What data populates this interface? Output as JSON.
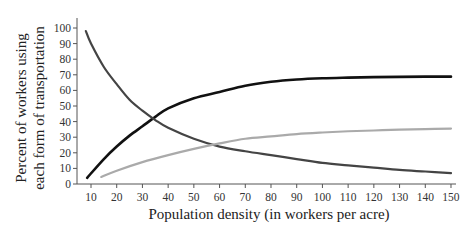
{
  "chart_data": {
    "type": "line",
    "title": "",
    "xlabel": "Population density (in workers per acre)",
    "ylabel_line1": "Percent of workers using",
    "ylabel_line2": "each form of transportation",
    "xlim": [
      5,
      152
    ],
    "ylim": [
      0,
      105
    ],
    "xticks": [
      10,
      20,
      30,
      40,
      50,
      60,
      70,
      80,
      90,
      100,
      110,
      120,
      130,
      140,
      150
    ],
    "yticks": [
      0,
      10,
      20,
      30,
      40,
      50,
      60,
      70,
      80,
      90,
      100
    ],
    "grid": false,
    "legend": "none",
    "series": [
      {
        "name": "Series 1 (black, rising)",
        "color": "#111111",
        "width": 2.6,
        "x": [
          8.5,
          15,
          20,
          25,
          30,
          35,
          40,
          50,
          60,
          70,
          80,
          90,
          100,
          110,
          120,
          130,
          140,
          150
        ],
        "y": [
          4,
          16,
          24,
          31,
          37,
          43,
          48.5,
          55,
          59,
          63,
          65.5,
          67,
          67.8,
          68.2,
          68.5,
          68.7,
          68.8,
          68.8
        ]
      },
      {
        "name": "Series 2 (dark gray, falling)",
        "color": "#444444",
        "width": 2.2,
        "x": [
          8,
          10,
          15,
          20,
          25,
          30,
          35,
          40,
          50,
          60,
          70,
          80,
          90,
          100,
          110,
          120,
          130,
          140,
          150
        ],
        "y": [
          98,
          90,
          75,
          64,
          54,
          47,
          41,
          36,
          29,
          24,
          21,
          18.5,
          16,
          13.5,
          12,
          10.5,
          9,
          8,
          7
        ]
      },
      {
        "name": "Series 3 (light gray, rising)",
        "color": "#aaaaaa",
        "width": 2.2,
        "x": [
          14,
          20,
          30,
          40,
          50,
          60,
          70,
          80,
          90,
          100,
          110,
          120,
          130,
          140,
          150
        ],
        "y": [
          4.5,
          8.5,
          14,
          18.5,
          22.5,
          26,
          29,
          30.5,
          32,
          33,
          33.8,
          34.3,
          34.8,
          35.2,
          35.5
        ]
      }
    ]
  },
  "layout": {
    "x0_px": 91,
    "x_per_unit": 2.5714,
    "y0_px": 184,
    "y_per_unit": 1.56,
    "axis_x_left": 77,
    "axis_x_right": 456,
    "axis_y_top": 18,
    "axis_y_bottom": 184
  }
}
